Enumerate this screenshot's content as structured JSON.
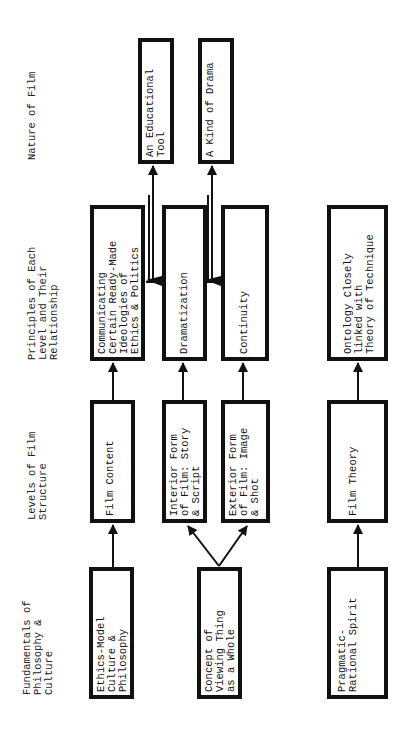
{
  "diagram": {
    "orientation": "rotated -90deg (read bottom-to-top)",
    "headers": [
      {
        "id": "nature",
        "text": "Nature of Film"
      },
      {
        "id": "principles",
        "text": "Principles of Each\nLevel and Their\nRelationship"
      },
      {
        "id": "levels",
        "text": "Levels of Film\nStructure"
      },
      {
        "id": "fundamentals",
        "text": "Fundamentals of\nPhilosophy &\nCulture"
      }
    ],
    "nodes": {
      "educational_tool": "An Educational\nTool",
      "kind_of_drama": "A Kind of Drama",
      "communicating": "Communicating\nCertain Ready-Made\nIdeologies of\nEthics & Politics",
      "dramatization": "Dramatization",
      "continuity": "Continuity",
      "ontology": "Ontology Closely\nlinked with\nTheory of Technique",
      "film_content": "Film Content",
      "interior_form": "Interior Form\nof Film: Story\n& Script",
      "exterior_form": "Exterior Form\nof Film: Image\n& Shot",
      "film_theory": "Film Theory",
      "ethics_model": "Ethics-Model\nCulture &\nPhilosophy",
      "concept_whole": "Concept of\nViewing Thing\nas a Whole",
      "pragmatic": "Pragmatic-\nRational Spirit"
    },
    "edges": [
      {
        "from": "ethics_model",
        "to": "film_content"
      },
      {
        "from": "concept_whole",
        "to": "interior_form"
      },
      {
        "from": "concept_whole",
        "to": "exterior_form"
      },
      {
        "from": "pragmatic",
        "to": "film_theory"
      },
      {
        "from": "film_content",
        "to": "communicating"
      },
      {
        "from": "interior_form",
        "to": "dramatization"
      },
      {
        "from": "exterior_form",
        "to": "continuity"
      },
      {
        "from": "film_theory",
        "to": "ontology"
      },
      {
        "from": "communicating",
        "to": "educational_tool"
      },
      {
        "from": "dramatization",
        "to": "educational_tool"
      },
      {
        "from": "dramatization",
        "to": "kind_of_drama"
      },
      {
        "from": "continuity",
        "to": "kind_of_drama"
      }
    ]
  }
}
